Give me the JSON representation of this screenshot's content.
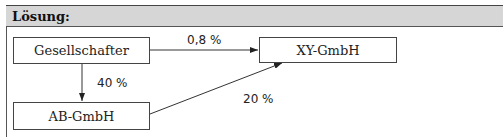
{
  "header": {
    "title": "Lösung:"
  },
  "diagram": {
    "nodes": [
      {
        "id": "gesellschafter",
        "label": "Gesellschafter"
      },
      {
        "id": "xy-gmbh",
        "label": "XY-GmbH"
      },
      {
        "id": "ab-gmbh",
        "label": "AB-GmbH"
      }
    ],
    "edges": [
      {
        "from": "gesellschafter",
        "to": "xy-gmbh",
        "label": "0,8 %"
      },
      {
        "from": "gesellschafter",
        "to": "ab-gmbh",
        "label": "40 %"
      },
      {
        "from": "ab-gmbh",
        "to": "xy-gmbh",
        "label": "20 %"
      }
    ]
  },
  "colors": {
    "header_bg": "#d6d6d6",
    "line": "#333333"
  }
}
